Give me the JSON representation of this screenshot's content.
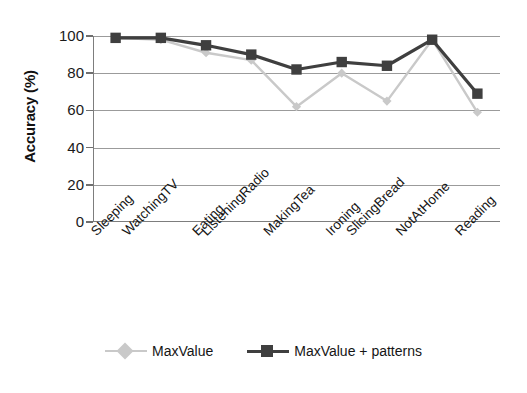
{
  "chart_data": {
    "type": "line",
    "title": "",
    "subtitle": "",
    "xlabel": "",
    "ylabel": "Accuracy (%)",
    "categories": [
      "Sleeping",
      "WatchingTV",
      "Eating",
      "ListeningRadio",
      "MakingTea",
      "Ironing",
      "SlicingBread",
      "NotAtHome",
      "Reading"
    ],
    "series": [
      {
        "name": "MaxValue",
        "color": "#c9c9c9",
        "marker": "diamond",
        "values": [
          99,
          98,
          91,
          87,
          62,
          80,
          65,
          98,
          59
        ]
      },
      {
        "name": "MaxValue + patterns",
        "color": "#3f3f3f",
        "marker": "square",
        "values": [
          99,
          99,
          95,
          90,
          82,
          86,
          84,
          98,
          69
        ]
      }
    ],
    "ylim": [
      0,
      100
    ],
    "y_ticks": [
      0,
      20,
      40,
      60,
      80,
      100
    ],
    "y_tick_labels": [
      "0",
      "20",
      "40",
      "60",
      "80",
      "100"
    ],
    "grid": true,
    "grid_axis": "y",
    "legend_position": "bottom"
  },
  "axes": {
    "y_title": "Accuracy (%)"
  },
  "legend": {
    "entries": [
      {
        "label": "MaxValue"
      },
      {
        "label": "MaxValue + patterns"
      }
    ]
  },
  "colors": {
    "series_light": "#c9c9c9",
    "series_dark": "#3f3f3f",
    "gridline": "#9b9b9b",
    "axis": "#7d7d7d",
    "text": "#151515",
    "background": "#ffffff"
  }
}
